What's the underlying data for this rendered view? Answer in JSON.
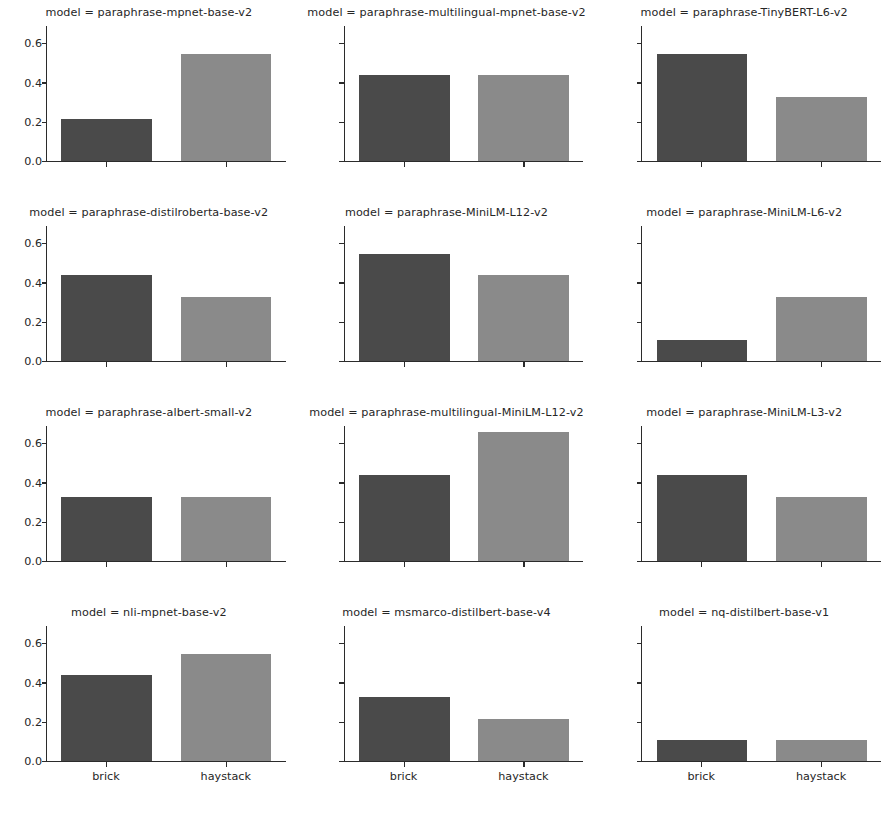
{
  "chart_data": {
    "type": "bar",
    "title": "",
    "subtitle": "",
    "xlabel": "",
    "ylabel": "",
    "categories": [
      "brick",
      "haystack"
    ],
    "ylim": [
      0.0,
      0.693
    ],
    "yticks": [
      "0.0",
      "0.2",
      "0.4",
      "0.6"
    ],
    "ytick_values": [
      0.0,
      0.2,
      0.4,
      0.6
    ],
    "grid": false,
    "legend": "none",
    "facet_variable": "model",
    "facet_rows": 4,
    "facet_cols": 3,
    "series_colors": {
      "brick": "#4a4a4a",
      "haystack": "#8a8a8a"
    },
    "panels": [
      {
        "title": "model = paraphrase-mpnet-base-v2",
        "facet_value": "paraphrase-mpnet-base-v2",
        "values": [
          0.216,
          0.55
        ]
      },
      {
        "title": "model = paraphrase-multilingual-mpnet-base-v2",
        "facet_value": "paraphrase-multilingual-mpnet-base-v2",
        "values": [
          0.44,
          0.44
        ]
      },
      {
        "title": "model = paraphrase-TinyBERT-L6-v2",
        "facet_value": "paraphrase-TinyBERT-L6-v2",
        "values": [
          0.55,
          0.33
        ]
      },
      {
        "title": "model = paraphrase-distilroberta-base-v2",
        "facet_value": "paraphrase-distilroberta-base-v2",
        "values": [
          0.44,
          0.33
        ]
      },
      {
        "title": "model = paraphrase-MiniLM-L12-v2",
        "facet_value": "paraphrase-MiniLM-L12-v2",
        "values": [
          0.55,
          0.44
        ]
      },
      {
        "title": "model = paraphrase-MiniLM-L6-v2",
        "facet_value": "paraphrase-MiniLM-L6-v2",
        "values": [
          0.11,
          0.33
        ]
      },
      {
        "title": "model = paraphrase-albert-small-v2",
        "facet_value": "paraphrase-albert-small-v2",
        "values": [
          0.33,
          0.33
        ]
      },
      {
        "title": "model = paraphrase-multilingual-MiniLM-L12-v2",
        "facet_value": "paraphrase-multilingual-MiniLM-L12-v2",
        "values": [
          0.44,
          0.66
        ]
      },
      {
        "title": "model = paraphrase-MiniLM-L3-v2",
        "facet_value": "paraphrase-MiniLM-L3-v2",
        "values": [
          0.44,
          0.33
        ]
      },
      {
        "title": "model = nli-mpnet-base-v2",
        "facet_value": "nli-mpnet-base-v2",
        "values": [
          0.44,
          0.55
        ]
      },
      {
        "title": "model = msmarco-distilbert-base-v4",
        "facet_value": "msmarco-distilbert-base-v4",
        "values": [
          0.33,
          0.216
        ]
      },
      {
        "title": "model = nq-distilbert-base-v1",
        "facet_value": "nq-distilbert-base-v1",
        "values": [
          0.11,
          0.11
        ]
      }
    ]
  }
}
